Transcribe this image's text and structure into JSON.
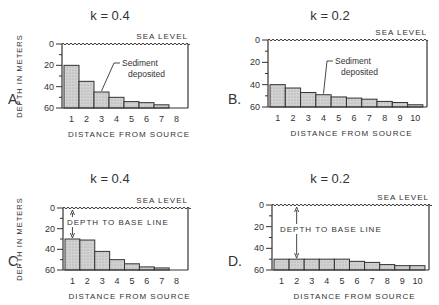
{
  "chart_data": [
    {
      "panel": "A.",
      "type": "bar",
      "title": "k = 0.4",
      "xlabel": "DISTANCE FROM SOURCE",
      "ylabel": "DEPTH IN METERS",
      "sea_level_label": "SEA LEVEL",
      "annotation": "Sediment deposited",
      "categories": [
        "1",
        "2",
        "3",
        "4",
        "5",
        "6",
        "7",
        "8"
      ],
      "values": [
        20,
        35,
        45,
        50,
        54,
        55,
        57,
        60
      ],
      "yticks": [
        "0",
        "20",
        "40",
        "60"
      ],
      "ylim": [
        0,
        60
      ],
      "y_inverted": true
    },
    {
      "panel": "B.",
      "type": "bar",
      "title": "k = 0.2",
      "xlabel": "DISTANCE FROM SOURCE",
      "ylabel": "",
      "sea_level_label": "SEA LEVEL",
      "annotation": "Sediment deposited",
      "categories": [
        "1",
        "2",
        "3",
        "4",
        "5",
        "6",
        "7",
        "8",
        "9",
        "10"
      ],
      "values": [
        40,
        43,
        47,
        49,
        51,
        52,
        53,
        55,
        56,
        58
      ],
      "yticks": [
        "0",
        "20",
        "40",
        "60"
      ],
      "ylim": [
        0,
        60
      ],
      "y_inverted": true
    },
    {
      "panel": "C.",
      "type": "bar",
      "title": "k = 0.4",
      "xlabel": "DISTANCE FROM SOURCE",
      "ylabel": "DEPTH IN METERS",
      "sea_level_label": "SEA LEVEL",
      "annotation": "DEPTH TO BASE LINE",
      "categories": [
        "1",
        "2",
        "3",
        "4",
        "5",
        "6",
        "7",
        "8"
      ],
      "values": [
        30,
        31,
        42,
        50,
        54,
        57,
        58,
        60
      ],
      "yticks": [
        "0",
        "20",
        "40",
        "60"
      ],
      "ylim": [
        0,
        60
      ],
      "y_inverted": true
    },
    {
      "panel": "D.",
      "type": "bar",
      "title": "k = 0.2",
      "xlabel": "DISTANCE FROM SOURCE",
      "ylabel": "",
      "sea_level_label": "SEA LEVEL",
      "annotation": "DEPTH TO BASE LINE",
      "categories": [
        "1",
        "2",
        "3",
        "4",
        "5",
        "6",
        "7",
        "8",
        "9",
        "10"
      ],
      "values": [
        50,
        50,
        50,
        50,
        50,
        52,
        53,
        55,
        56,
        56
      ],
      "yticks": [
        "0",
        "20",
        "40",
        "60"
      ],
      "ylim": [
        0,
        60
      ],
      "y_inverted": true
    }
  ],
  "layout": [
    {
      "x0": 62,
      "x1": 188,
      "y0": 44,
      "y60": 108,
      "title_x": 110,
      "title_y": 20,
      "letter_x": 8,
      "letter_y": 104,
      "ylab_x": 50
    },
    {
      "x0": 268,
      "x1": 427,
      "y0": 40,
      "y60": 107,
      "title_x": 330,
      "title_y": 20,
      "letter_x": 228,
      "letter_y": 104,
      "ylab_x": null
    },
    {
      "x0": 63,
      "x1": 188,
      "y0": 208,
      "y60": 270,
      "title_x": 110,
      "title_y": 183,
      "letter_x": 8,
      "letter_y": 266,
      "ylab_x": 50
    },
    {
      "x0": 272,
      "x1": 429,
      "y0": 205,
      "y60": 270,
      "title_x": 330,
      "title_y": 183,
      "letter_x": 228,
      "letter_y": 266,
      "ylab_x": null
    }
  ],
  "colors": {
    "bar_fill": "#c9c9c9",
    "line": "#333333"
  }
}
